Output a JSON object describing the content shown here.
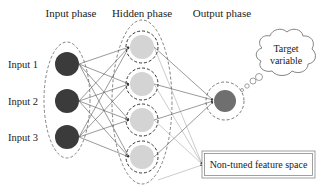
{
  "diagram": {
    "phases": {
      "input": "Input phase",
      "hidden": "Hidden phase",
      "output": "Output phase"
    },
    "inputs": [
      "Input 1",
      "Input 2",
      "Input 3"
    ],
    "hidden_node_count": 4,
    "output_node_count": 1,
    "target": {
      "line1": "Target",
      "line2": "variable"
    },
    "feature_box": "Non-tuned feature space",
    "colors": {
      "input_node": "#3b3b3b",
      "hidden_node": "#d4d4d4",
      "output_node": "#6f6f6f",
      "edge": "#555555",
      "dashed": "#444444"
    }
  }
}
